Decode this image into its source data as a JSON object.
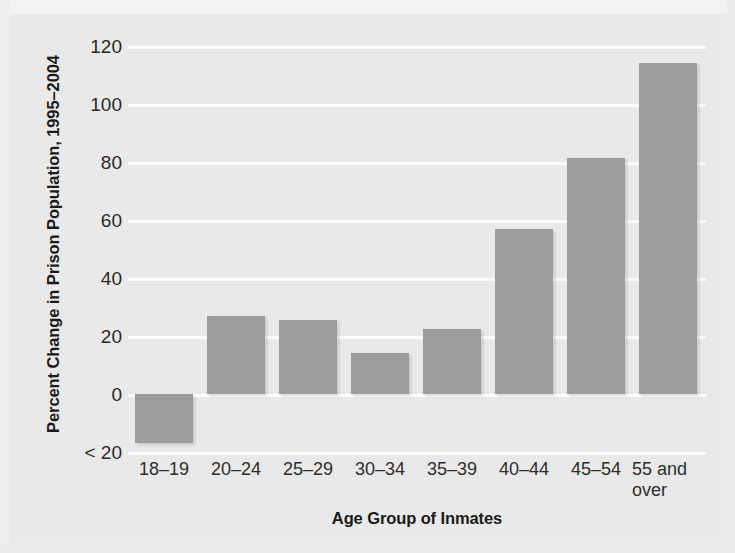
{
  "chart_data": {
    "type": "bar",
    "title": "",
    "xlabel": "Age Group of Inmates",
    "ylabel": "Percent Change in Prison Population, 1995–2004",
    "categories": [
      "18–19",
      "20–24",
      "25–29",
      "30–34",
      "35–39",
      "40–44",
      "45–54",
      "55 and over"
    ],
    "values": [
      -17,
      27,
      25.5,
      14,
      22.5,
      57,
      81.5,
      114
    ],
    "ylim": [
      -20,
      120
    ],
    "ytick_values": [
      120,
      100,
      80,
      60,
      40,
      20,
      0,
      -20
    ],
    "ytick_labels": [
      "120",
      "100",
      "80",
      "60",
      "40",
      "20",
      "0",
      "< 20"
    ],
    "grid": true,
    "legend": "none",
    "bar_color": "#9d9d9d",
    "gridline_color": "#fbfbfb",
    "background_color": "#e9e9e9",
    "text_color": "#1a1a1a"
  },
  "axes": {
    "y_title": "Percent Change in Prison Population, 1995–2004",
    "x_title": "Age Group of Inmates"
  },
  "ytick_labels": {
    "t0": "120",
    "t1": "100",
    "t2": "80",
    "t3": "60",
    "t4": "40",
    "t5": "20",
    "t6": "0",
    "t7": "< 20"
  },
  "xtick_labels": {
    "c0": "18–19",
    "c1": "20–24",
    "c2": "25–29",
    "c3": "30–34",
    "c4": "35–39",
    "c5": "40–44",
    "c6": "45–54",
    "c7a": "55 and",
    "c7b": "over"
  }
}
